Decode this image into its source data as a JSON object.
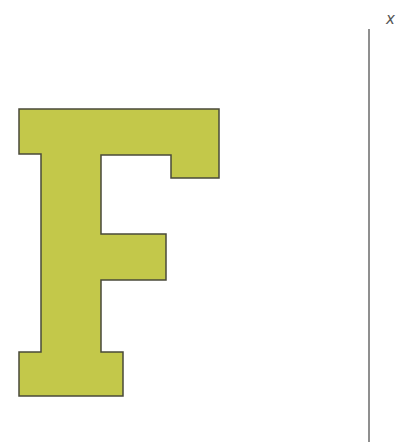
{
  "figure": {
    "letter": "F",
    "fill_color": "#c3c84a",
    "stroke_color": "#4a4a3a",
    "line_color": "#6a6a6a",
    "axis_label": "x"
  }
}
